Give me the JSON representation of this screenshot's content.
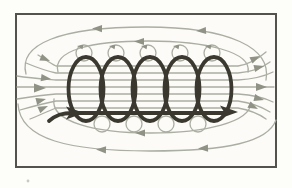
{
  "figure": {
    "type": "physics-diagram",
    "coil_turns": 5,
    "current_direction": "enters at lower-left wire end, exits at lower-right wire end (arrows point right)",
    "field_direction_inside_coil": "left to right",
    "field_return_direction_outside": "right to left above and below the coil (closed loops)",
    "field_lines": {
      "interior_lines": 7,
      "top_return_loops": 2,
      "bottom_return_loops": 2,
      "small_loops_around_top_wires": 5,
      "small_loops_around_bottom_wires": 4
    },
    "visible_text": ""
  },
  "colors": {
    "page_background": "#fdfdfa",
    "panel_background": "#fcfbf7",
    "frame_border": "#53524c",
    "coil": "#3a382f",
    "field_line": "#abaea2",
    "field_arrow": "#8f9285",
    "artifact": "#c9c8c2"
  }
}
